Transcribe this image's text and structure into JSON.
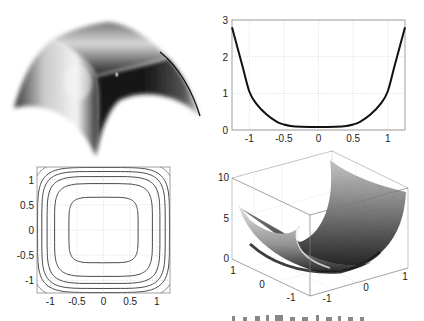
{
  "figure": {
    "panels": [
      {
        "id": "surface-dome",
        "kind": "3d-shaded-surface",
        "description": "shaded dome-like surface, axes hidden"
      },
      {
        "id": "line-plot",
        "kind": "line"
      },
      {
        "id": "contour-plot",
        "kind": "contour"
      },
      {
        "id": "surface-bowl",
        "kind": "3d-mesh-surface"
      }
    ],
    "caption_fragment": ""
  },
  "chart_data": [
    {
      "type": "surface",
      "title": "",
      "note": "Shaded 3D dome surface (upper-left), no axes shown"
    },
    {
      "type": "line",
      "title": "",
      "xlabel": "",
      "ylabel": "",
      "xlim": [
        -1.25,
        1.25
      ],
      "ylim": [
        0,
        3
      ],
      "grid": true,
      "xticks": [
        "-1",
        "-0.5",
        "0",
        "0.5",
        "1"
      ],
      "yticks": [
        "0",
        "1",
        "2",
        "3"
      ],
      "series": [
        {
          "name": "curve",
          "x": [
            -1.25,
            -1.1,
            -1.0,
            -0.9,
            -0.75,
            -0.6,
            -0.5,
            -0.4,
            -0.25,
            0,
            0.25,
            0.4,
            0.5,
            0.6,
            0.75,
            0.9,
            1.0,
            1.1,
            1.25
          ],
          "y": [
            2.8,
            1.75,
            1.05,
            0.72,
            0.42,
            0.22,
            0.15,
            0.11,
            0.09,
            0.08,
            0.09,
            0.11,
            0.15,
            0.22,
            0.42,
            0.72,
            1.05,
            1.75,
            2.8
          ]
        }
      ]
    },
    {
      "type": "contour",
      "title": "",
      "xlim": [
        -1.25,
        1.25
      ],
      "ylim": [
        -1.25,
        1.25
      ],
      "grid": true,
      "xticks": [
        "-1",
        "-0.5",
        "0",
        "0.5",
        "1"
      ],
      "yticks": [
        "-1",
        "-0.5",
        "0",
        "0.5",
        "1"
      ],
      "levels_half_width": [
        0.65,
        0.92,
        1.06,
        1.16,
        1.24
      ]
    },
    {
      "type": "surface",
      "title": "",
      "zlim": [
        0,
        10
      ],
      "zticks": [
        "0",
        "5",
        "10"
      ],
      "xticks": [
        "-1",
        "0",
        "1"
      ],
      "yticks": [
        "-1",
        "0",
        "1"
      ],
      "grid": true
    }
  ]
}
